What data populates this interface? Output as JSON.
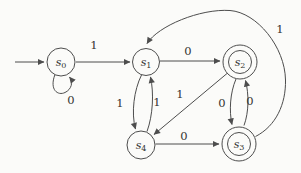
{
  "figure": {
    "type": "finite-state-automaton",
    "background_color": "#fbfbf9",
    "line_color": "#4d4d4d",
    "text_color": "#333330",
    "start_state": "s0",
    "accepting_states": [
      "s2",
      "s3"
    ],
    "states": [
      {
        "id": "s0",
        "base": "s",
        "sub": "0",
        "start": true,
        "accepting": false
      },
      {
        "id": "s1",
        "base": "s",
        "sub": "1",
        "start": false,
        "accepting": false
      },
      {
        "id": "s2",
        "base": "s",
        "sub": "2",
        "start": false,
        "accepting": true
      },
      {
        "id": "s3",
        "base": "s",
        "sub": "3",
        "start": false,
        "accepting": true
      },
      {
        "id": "s4",
        "base": "s",
        "sub": "4",
        "start": false,
        "accepting": false
      }
    ],
    "transitions": [
      {
        "from": "s0",
        "to": "s0",
        "label": "0"
      },
      {
        "from": "s0",
        "to": "s1",
        "label": "1"
      },
      {
        "from": "s1",
        "to": "s2",
        "label": "0"
      },
      {
        "from": "s1",
        "to": "s4",
        "label": "1"
      },
      {
        "from": "s4",
        "to": "s1",
        "label": "1"
      },
      {
        "from": "s2",
        "to": "s4",
        "label": "1"
      },
      {
        "from": "s2",
        "to": "s3",
        "label": "0"
      },
      {
        "from": "s3",
        "to": "s2",
        "label": "0"
      },
      {
        "from": "s4",
        "to": "s3",
        "label": "0"
      },
      {
        "from": "s3",
        "to": "s1",
        "label": "1"
      }
    ]
  }
}
